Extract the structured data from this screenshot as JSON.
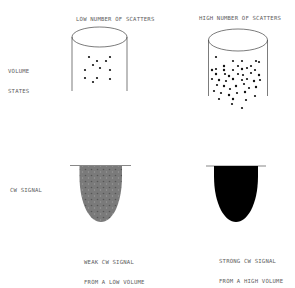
{
  "row_labels": {
    "volume_states": [
      "VOLUME",
      "STATES"
    ],
    "cw_signal": "CW SIGNAL"
  },
  "columns": [
    {
      "heading": "LOW NUMBER OF SCATTERS",
      "caption": [
        "WEAK CW SIGNAL",
        "FROM A LOW VOLUME"
      ],
      "scatter_density": "low",
      "signal_fill": "#777777"
    },
    {
      "heading": "HIGH NUMBER OF SCATTERS",
      "caption": [
        "STRONG CW SIGNAL",
        "FROM A HIGH VOLUME"
      ],
      "scatter_density": "high",
      "signal_fill": "#000000"
    }
  ]
}
